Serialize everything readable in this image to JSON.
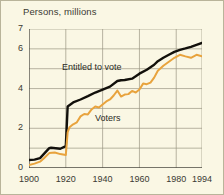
{
  "chart_data": {
    "type": "line",
    "title": "Persons, millions",
    "xlabel": "",
    "ylabel": "Persons, millions",
    "xlim": [
      1900,
      1994
    ],
    "ylim": [
      0,
      7
    ],
    "grid": true,
    "legend_position": "inline-annotation",
    "y_ticks": [
      0,
      2,
      4,
      6,
      7
    ],
    "y_tick_labels": [
      "0",
      "2",
      "4",
      "6",
      "7"
    ],
    "y_minor_ticks": [
      1,
      3,
      5
    ],
    "x_ticks": [
      1900,
      1920,
      1940,
      1960,
      1980,
      1994
    ],
    "x_tick_labels": [
      "1900",
      "1920",
      "1940",
      "1960",
      "1980",
      "1994"
    ],
    "annotations": [
      {
        "text": "Entitled to vote",
        "x": 1932,
        "y": 5.05
      },
      {
        "text": "Voters",
        "x": 1950,
        "y": 2.45
      }
    ],
    "series": [
      {
        "name": "Entitled to vote",
        "color": "#12100b",
        "x": [
          1900,
          1903,
          1906,
          1908,
          1911,
          1912,
          1917,
          1920,
          1921,
          1924,
          1928,
          1932,
          1936,
          1940,
          1944,
          1948,
          1950,
          1952,
          1956,
          1958,
          1960,
          1964,
          1968,
          1970,
          1973,
          1976,
          1979,
          1982,
          1985,
          1988,
          1991,
          1994
        ],
        "values": [
          0.4,
          0.42,
          0.5,
          0.7,
          1.0,
          1.02,
          0.97,
          1.1,
          3.1,
          3.3,
          3.45,
          3.62,
          3.8,
          3.95,
          4.1,
          4.38,
          4.42,
          4.43,
          4.5,
          4.62,
          4.75,
          4.95,
          5.2,
          5.38,
          5.55,
          5.7,
          5.85,
          5.95,
          6.02,
          6.1,
          6.2,
          6.3
        ]
      },
      {
        "name": "Voters",
        "color": "#e8a33d",
        "x": [
          1900,
          1903,
          1906,
          1908,
          1911,
          1914,
          1917,
          1920,
          1921,
          1922,
          1924,
          1926,
          1928,
          1930,
          1932,
          1934,
          1936,
          1938,
          1940,
          1942,
          1944,
          1946,
          1948,
          1950,
          1952,
          1954,
          1956,
          1958,
          1960,
          1962,
          1964,
          1966,
          1968,
          1970,
          1973,
          1976,
          1979,
          1982,
          1985,
          1988,
          1991,
          1994
        ],
        "values": [
          0.15,
          0.22,
          0.32,
          0.48,
          0.75,
          0.78,
          0.7,
          0.65,
          1.8,
          2.05,
          2.2,
          2.3,
          2.6,
          2.72,
          2.7,
          2.95,
          3.1,
          3.05,
          3.2,
          3.35,
          3.45,
          3.65,
          3.9,
          3.6,
          3.7,
          3.72,
          3.88,
          3.8,
          3.95,
          4.25,
          4.22,
          4.3,
          4.55,
          4.9,
          5.15,
          5.35,
          5.55,
          5.7,
          5.62,
          5.55,
          5.7,
          5.62
        ]
      }
    ]
  },
  "axis": {
    "y_labels": [
      "7",
      "6",
      "4",
      "2",
      "0"
    ],
    "x_labels": [
      "1900",
      "1920",
      "1940",
      "1960",
      "1980",
      "1994"
    ]
  },
  "colors": {
    "background": "#faf7e4",
    "frame": "#b9b49a",
    "grid": "#9a9582",
    "axis": "#4a4840",
    "entitled": "#12100b",
    "voters": "#e8a33d"
  }
}
